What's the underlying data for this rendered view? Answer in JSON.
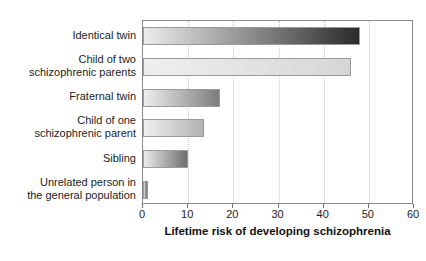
{
  "chart_data": {
    "type": "bar",
    "orientation": "horizontal",
    "title": "",
    "xlabel": "Lifetime risk of developing schizophrenia",
    "ylabel": "",
    "xlim": [
      0,
      60
    ],
    "xticks": [
      0,
      10,
      20,
      30,
      40,
      50,
      60
    ],
    "xtick_labels": [
      "0",
      "10",
      "20",
      "30",
      "40",
      "50",
      "60"
    ],
    "grid": "vertical-dotted",
    "legend": "none",
    "categories": [
      "Identical twin",
      "Child of two\nschizophrenic parents",
      "Fraternal twin",
      "Child of one\nschizophrenic parent",
      "Sibling",
      "Unrelated person in\nthe general population"
    ],
    "values": [
      48,
      46,
      17,
      13.5,
      10,
      1
    ],
    "bars": [
      {
        "label": "Identical twin",
        "value": 48,
        "fill_start": "#ececec",
        "fill_end": "#2b2b2b"
      },
      {
        "label": "Child of two schizophrenic parents",
        "value": 46,
        "fill_start": "#efefef",
        "fill_end": "#d6d6d6"
      },
      {
        "label": "Fraternal twin",
        "value": 17,
        "fill_start": "#ededed",
        "fill_end": "#7d7d7d"
      },
      {
        "label": "Child of one schizophrenic parent",
        "value": 13.5,
        "fill_start": "#efefef",
        "fill_end": "#b2b2b2"
      },
      {
        "label": "Sibling",
        "value": 10,
        "fill_start": "#ebebeb",
        "fill_end": "#6e6e6e"
      },
      {
        "label": "Unrelated person in the general population",
        "value": 1,
        "fill_start": "#d8d8d8",
        "fill_end": "#6a6a6a"
      }
    ],
    "colors": {
      "background": "#ffffff",
      "plot_border": "#8a8a8a",
      "gridline": "#c9c9c9",
      "text": "#1c1c1c"
    }
  }
}
